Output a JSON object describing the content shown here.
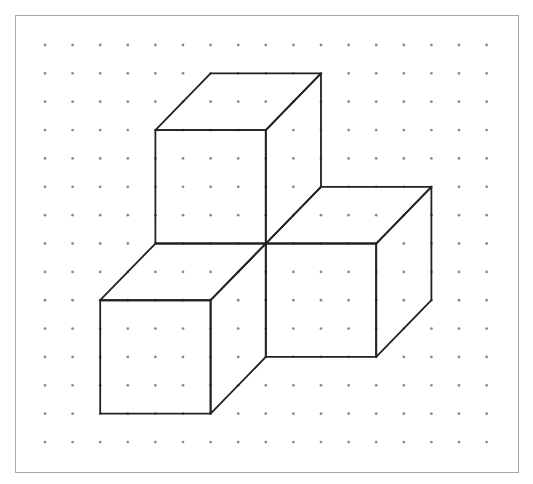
{
  "figure": {
    "frame": {
      "left": 15,
      "top": 15,
      "right": 519,
      "bottom": 473,
      "border_color": "#a8a8a8"
    },
    "dot_grid": {
      "cols": 17,
      "rows": 15,
      "x0": 45,
      "dx": 27.6,
      "y0": 45,
      "dy": 28.36,
      "dot_radius": 1.4,
      "dot_color": "#8c8c8c"
    },
    "stroke": {
      "color": "#222222",
      "width": 1.8
    },
    "cubes": [
      {
        "name": "top-cube",
        "front_face": [
          [
            4,
            3
          ],
          [
            8,
            3
          ],
          [
            8,
            7
          ],
          [
            4,
            7
          ]
        ],
        "top_face": [
          [
            4,
            3
          ],
          [
            6,
            1
          ],
          [
            10,
            1
          ],
          [
            8,
            3
          ]
        ],
        "side_face": [
          [
            8,
            3
          ],
          [
            10,
            1
          ],
          [
            10,
            5
          ],
          [
            8,
            7
          ]
        ]
      },
      {
        "name": "right-cube",
        "front_face": [
          [
            8,
            7
          ],
          [
            12,
            7
          ],
          [
            12,
            11
          ],
          [
            8,
            11
          ]
        ],
        "top_face": [
          [
            8,
            7
          ],
          [
            10,
            5
          ],
          [
            14,
            5
          ],
          [
            12,
            7
          ]
        ],
        "side_face": [
          [
            12,
            7
          ],
          [
            14,
            5
          ],
          [
            14,
            9
          ],
          [
            12,
            11
          ]
        ]
      },
      {
        "name": "left-cube",
        "front_face": [
          [
            2,
            9
          ],
          [
            6,
            9
          ],
          [
            6,
            13
          ],
          [
            2,
            13
          ]
        ],
        "top_face": [
          [
            2,
            9
          ],
          [
            4,
            7
          ],
          [
            8,
            7
          ],
          [
            6,
            9
          ]
        ],
        "side_face": [
          [
            6,
            9
          ],
          [
            8,
            7
          ],
          [
            8,
            11
          ],
          [
            6,
            13
          ]
        ]
      }
    ]
  }
}
